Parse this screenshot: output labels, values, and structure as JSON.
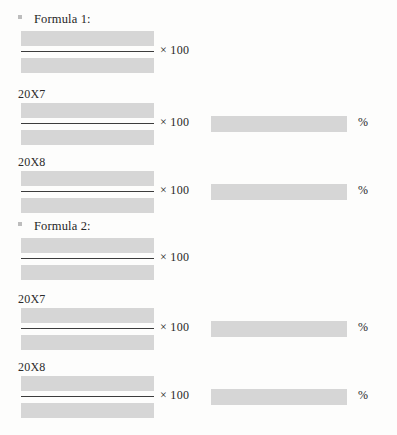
{
  "document": {
    "type": "scanned-worksheet-page",
    "background_color": "#fdfdfc",
    "redaction_color": "#d6d6d6",
    "rule_color": "#3c3c3c",
    "text_color": "#2a2a2a",
    "multiplier_label": "× 100",
    "percent_label": "%",
    "sections": [
      {
        "bullet_icon": "square-bullet-icon",
        "title": "Formula 1:",
        "rows": [
          {
            "year": "",
            "has_year_label": false,
            "numerator_redacted": true,
            "denominator_redacted": true,
            "multiplier": "× 100",
            "has_result": false,
            "result_redacted": false,
            "percent": ""
          },
          {
            "year": "20X7",
            "has_year_label": true,
            "numerator_redacted": true,
            "denominator_redacted": true,
            "multiplier": "× 100",
            "has_result": true,
            "result_redacted": true,
            "percent": "%"
          },
          {
            "year": "20X8",
            "has_year_label": true,
            "numerator_redacted": true,
            "denominator_redacted": true,
            "multiplier": "× 100",
            "has_result": true,
            "result_redacted": true,
            "percent": "%"
          }
        ]
      },
      {
        "bullet_icon": "square-bullet-icon",
        "title": "Formula 2:",
        "rows": [
          {
            "year": "",
            "has_year_label": false,
            "numerator_redacted": true,
            "denominator_redacted": true,
            "multiplier": "× 100",
            "has_result": false,
            "result_redacted": false,
            "percent": ""
          },
          {
            "year": "20X7",
            "has_year_label": true,
            "numerator_redacted": true,
            "denominator_redacted": true,
            "multiplier": "× 100",
            "has_result": true,
            "result_redacted": true,
            "percent": "%"
          },
          {
            "year": "20X8",
            "has_year_label": true,
            "numerator_redacted": true,
            "denominator_redacted": true,
            "multiplier": "× 100",
            "has_result": true,
            "result_redacted": true,
            "percent": "%"
          }
        ]
      }
    ]
  }
}
